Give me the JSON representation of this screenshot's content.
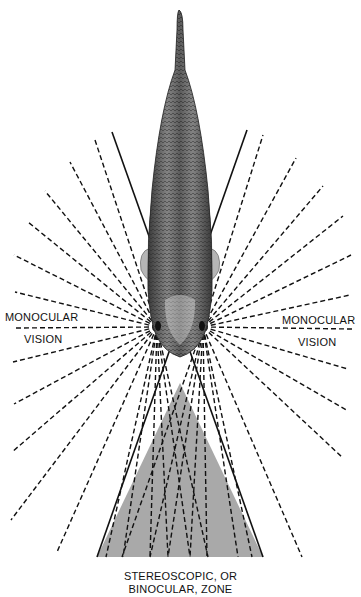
{
  "figure": {
    "labels": {
      "left_monocular_line1": "MONOCULAR",
      "left_monocular_line2": "VISION",
      "right_monocular_line1": "MONOCULAR",
      "right_monocular_line2": "VISION",
      "binocular_line1": "STEREOSCOPIC, OR",
      "binocular_line2": "BINOCULAR, ZONE"
    },
    "colors": {
      "background": "#ffffff",
      "ink": "#111111",
      "binocular_fill": "#a9a9a9",
      "fish_dark": "#3a3a3a",
      "fish_light": "#9a9a9a"
    },
    "eyes": {
      "left": [
        157,
        327
      ],
      "right": [
        203,
        327
      ]
    },
    "field_boundaries": {
      "left_solid_line": [
        [
          112,
          132
        ],
        [
          263,
          557
        ]
      ],
      "right_solid_line": [
        [
          247,
          130
        ],
        [
          97,
          557
        ]
      ]
    },
    "binocular_triangle": [
      [
        180,
        383
      ],
      [
        97,
        557
      ],
      [
        263,
        557
      ]
    ],
    "left_eye_rays": [
      [
        95,
        140
      ],
      [
        70,
        162
      ],
      [
        45,
        191
      ],
      [
        28,
        222
      ],
      [
        14,
        255
      ],
      [
        15,
        292
      ],
      [
        14,
        328
      ],
      [
        13,
        362
      ],
      [
        14,
        404
      ],
      [
        12,
        452
      ],
      [
        11,
        520
      ],
      [
        57,
        552
      ],
      [
        106,
        557
      ],
      [
        123,
        557
      ],
      [
        150,
        557
      ],
      [
        168,
        557
      ],
      [
        190,
        557
      ],
      [
        208,
        557
      ]
    ],
    "right_eye_rays": [
      [
        263,
        135
      ],
      [
        296,
        158
      ],
      [
        323,
        186
      ],
      [
        343,
        216
      ],
      [
        351,
        255
      ],
      [
        350,
        295
      ],
      [
        352,
        329
      ],
      [
        348,
        369
      ],
      [
        348,
        411
      ],
      [
        343,
        458
      ],
      [
        302,
        557
      ],
      [
        252,
        557
      ],
      [
        238,
        557
      ],
      [
        207,
        557
      ],
      [
        190,
        557
      ],
      [
        168,
        557
      ],
      [
        150,
        557
      ],
      [
        122,
        557
      ]
    ]
  }
}
